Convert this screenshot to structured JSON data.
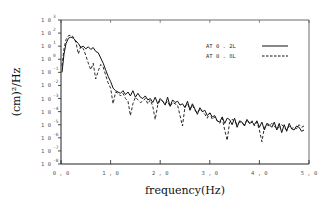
{
  "chart_data": {
    "type": "line",
    "title": "",
    "xlabel": "frequency(Hz)",
    "ylabel": "(cm)^2/Hz",
    "xlim": [
      0.0,
      5.0
    ],
    "ylim_log10": [
      -8,
      3
    ],
    "y_scale": "log",
    "grid": false,
    "legend_position": "upper right",
    "x_ticks": [
      "0.0",
      "1.0",
      "2.0",
      "3.0",
      "4.0",
      "5.0"
    ],
    "y_ticks": [
      {
        "base": "10",
        "exp": "3"
      },
      {
        "base": "10",
        "exp": "2"
      },
      {
        "base": "10",
        "exp": "1"
      },
      {
        "base": "10",
        "exp": "0"
      },
      {
        "base": "10",
        "exp": "-1"
      },
      {
        "base": "10",
        "exp": "-2"
      },
      {
        "base": "10",
        "exp": "-3"
      },
      {
        "base": "10",
        "exp": "-4"
      },
      {
        "base": "10",
        "exp": "-5"
      },
      {
        "base": "10",
        "exp": "-6"
      },
      {
        "base": "10",
        "exp": "-7"
      },
      {
        "base": "10",
        "exp": "-8"
      }
    ],
    "series": [
      {
        "name": "AT 0.2L",
        "style": "solid",
        "x": [
          0.02,
          0.06,
          0.1,
          0.15,
          0.2,
          0.25,
          0.3,
          0.35,
          0.4,
          0.45,
          0.5,
          0.55,
          0.6,
          0.65,
          0.7,
          0.75,
          0.8,
          0.85,
          0.9,
          0.95,
          1.0,
          1.05,
          1.1,
          1.15,
          1.2,
          1.25,
          1.3,
          1.35,
          1.4,
          1.45,
          1.5,
          1.55,
          1.6,
          1.65,
          1.7,
          1.75,
          1.8,
          1.85,
          1.9,
          1.95,
          2.0,
          2.05,
          2.1,
          2.15,
          2.2,
          2.25,
          2.3,
          2.35,
          2.4,
          2.45,
          2.5,
          2.55,
          2.6,
          2.65,
          2.7,
          2.75,
          2.8,
          2.85,
          2.9,
          2.95,
          3.0,
          3.05,
          3.1,
          3.15,
          3.2,
          3.25,
          3.3,
          3.35,
          3.4,
          3.45,
          3.5,
          3.55,
          3.6,
          3.65,
          3.7,
          3.75,
          3.8,
          3.85,
          3.9,
          3.95,
          4.0,
          4.05,
          4.1,
          4.15,
          4.2,
          4.25,
          4.3,
          4.35,
          4.4,
          4.45,
          4.5,
          4.55,
          4.6,
          4.65,
          4.7,
          4.75,
          4.8,
          4.85,
          4.9
        ],
        "log10_y": [
          -1.0,
          0.4,
          1.2,
          1.6,
          1.7,
          1.6,
          1.4,
          1.2,
          0.9,
          1.0,
          0.8,
          0.95,
          0.75,
          0.9,
          0.6,
          0.5,
          0.1,
          -0.3,
          -0.8,
          -1.3,
          -1.7,
          -2.2,
          -2.4,
          -2.5,
          -2.6,
          -2.4,
          -2.7,
          -2.5,
          -2.8,
          -2.4,
          -2.9,
          -2.6,
          -2.9,
          -3.0,
          -2.8,
          -3.1,
          -3.0,
          -3.3,
          -2.9,
          -3.4,
          -3.0,
          -3.2,
          -3.5,
          -2.9,
          -3.6,
          -3.1,
          -3.3,
          -3.2,
          -3.5,
          -3.4,
          -3.7,
          -3.2,
          -3.9,
          -3.4,
          -3.8,
          -4.2,
          -3.7,
          -4.0,
          -3.9,
          -4.3,
          -4.1,
          -4.4,
          -4.3,
          -4.7,
          -4.8,
          -4.4,
          -4.9,
          -4.5,
          -4.6,
          -5.0,
          -4.5,
          -5.2,
          -4.7,
          -4.8,
          -5.1,
          -4.6,
          -4.9,
          -4.8,
          -5.0,
          -4.7,
          -5.2,
          -4.8,
          -5.4,
          -4.9,
          -5.0,
          -5.2,
          -4.8,
          -5.4,
          -4.9,
          -5.6,
          -5.0,
          -5.5,
          -4.9,
          -5.3,
          -5.4,
          -5.1,
          -5.2,
          -5.5,
          -5.4
        ],
        "color": "#111111"
      },
      {
        "name": "AT 0.8L",
        "style": "dashed",
        "x": [
          0.02,
          0.06,
          0.1,
          0.15,
          0.2,
          0.25,
          0.3,
          0.35,
          0.4,
          0.45,
          0.5,
          0.55,
          0.6,
          0.65,
          0.7,
          0.75,
          0.8,
          0.85,
          0.9,
          0.95,
          1.0,
          1.05,
          1.1,
          1.15,
          1.2,
          1.25,
          1.3,
          1.35,
          1.4,
          1.45,
          1.5,
          1.55,
          1.6,
          1.65,
          1.7,
          1.75,
          1.8,
          1.85,
          1.9,
          1.95,
          2.0,
          2.05,
          2.1,
          2.15,
          2.2,
          2.25,
          2.3,
          2.35,
          2.4,
          2.45,
          2.5,
          2.55,
          2.6,
          2.65,
          2.7,
          2.75,
          2.8,
          2.85,
          2.9,
          2.95,
          3.0,
          3.05,
          3.1,
          3.15,
          3.2,
          3.25,
          3.3,
          3.35,
          3.4,
          3.45,
          3.5,
          3.55,
          3.6,
          3.65,
          3.7,
          3.75,
          3.8,
          3.85,
          3.9,
          3.95,
          4.0,
          4.05,
          4.1,
          4.15,
          4.2,
          4.25,
          4.3,
          4.35,
          4.4,
          4.45,
          4.5,
          4.55,
          4.6,
          4.65,
          4.7,
          4.75,
          4.8,
          4.85,
          4.9
        ],
        "log10_y": [
          -0.5,
          0.8,
          1.5,
          1.8,
          1.85,
          1.7,
          1.3,
          0.4,
          1.0,
          0.8,
          0.3,
          -0.3,
          -0.8,
          -0.3,
          -1.5,
          -0.9,
          -0.4,
          -0.6,
          -1.2,
          -1.8,
          -2.2,
          -3.4,
          -2.5,
          -2.6,
          -2.8,
          -2.6,
          -3.0,
          -3.2,
          -4.3,
          -3.4,
          -2.9,
          -3.1,
          -3.3,
          -3.2,
          -3.0,
          -3.4,
          -3.1,
          -3.6,
          -4.6,
          -3.5,
          -3.1,
          -3.2,
          -3.4,
          -3.2,
          -3.6,
          -3.3,
          -3.4,
          -3.5,
          -4.3,
          -5.1,
          -3.6,
          -3.4,
          -3.8,
          -3.5,
          -3.9,
          -4.1,
          -3.8,
          -4.0,
          -4.2,
          -4.5,
          -4.1,
          -4.6,
          -4.4,
          -4.7,
          -4.9,
          -4.5,
          -5.4,
          -6.2,
          -4.8,
          -4.6,
          -4.7,
          -5.0,
          -4.8,
          -4.9,
          -5.0,
          -4.6,
          -4.9,
          -4.7,
          -5.1,
          -4.8,
          -5.4,
          -6.3,
          -5.2,
          -5.0,
          -5.1,
          -4.9,
          -5.1,
          -5.3,
          -5.2,
          -5.0,
          -5.2,
          -5.4,
          -5.1,
          -5.3,
          -5.2,
          -5.3,
          -5.0,
          -5.2,
          -5.1
        ],
        "color": "#111111"
      }
    ]
  },
  "legend": {
    "items": [
      {
        "label": "AT 0.2L",
        "style": "solid"
      },
      {
        "label": "AT 0.8L",
        "style": "dashed"
      }
    ]
  },
  "axes": {
    "x_title": "frequency(Hz)",
    "y_title": "(cm)²/Hz"
  }
}
